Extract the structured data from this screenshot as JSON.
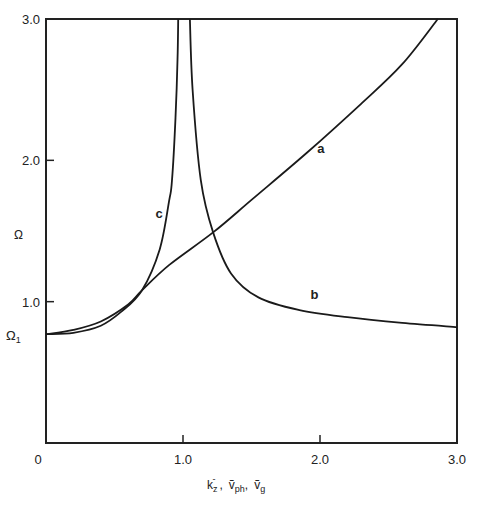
{
  "chart_data": {
    "type": "line",
    "title": "",
    "xlabel": "k_z^-, ṽ_ph, ṽ_g",
    "xlabel_parts": {
      "k": "k",
      "k_sub": "z",
      "k_sup": "-",
      "sep1": ",",
      "vph": "ṽ",
      "vph_sub": "ph",
      "sep2": ",",
      "vg": "ṽ",
      "vg_sub": "g"
    },
    "ylabel": "Ω",
    "xlim": [
      0,
      3.0
    ],
    "ylim": [
      0,
      3.0
    ],
    "grid": false,
    "x_ticks": [
      {
        "value": 0,
        "label": "0"
      },
      {
        "value": 1.0,
        "label": "1.0"
      },
      {
        "value": 2.0,
        "label": "2.0"
      },
      {
        "value": 3.0,
        "label": "3.0"
      }
    ],
    "y_ticks": [
      {
        "value": 1.0,
        "label": "1.0"
      },
      {
        "value": 2.0,
        "label": "2.0"
      },
      {
        "value": 3.0,
        "label": "3.0"
      }
    ],
    "y_annotation": {
      "value": 0.77,
      "label": "Ω",
      "sub": "1"
    },
    "series": [
      {
        "name": "a",
        "label_at": [
          1.98,
          2.05
        ],
        "x": [
          0,
          0.2,
          0.4,
          0.6,
          0.7,
          0.9,
          1.22,
          1.5,
          1.9,
          2.3,
          2.6,
          2.86
        ],
        "y": [
          0.77,
          0.8,
          0.86,
          0.98,
          1.08,
          1.26,
          1.49,
          1.72,
          2.05,
          2.4,
          2.68,
          3.0
        ]
      },
      {
        "name": "b",
        "label_at": [
          1.93,
          1.02
        ],
        "x": [
          1.05,
          1.07,
          1.13,
          1.22,
          1.35,
          1.55,
          1.85,
          2.2,
          2.6,
          3.0
        ],
        "y": [
          3.0,
          2.5,
          1.86,
          1.49,
          1.2,
          1.03,
          0.94,
          0.89,
          0.85,
          0.82
        ]
      },
      {
        "name": "c",
        "label_at": [
          0.8,
          1.59
        ],
        "x": [
          0,
          0.2,
          0.4,
          0.55,
          0.7,
          0.83,
          0.9,
          0.92,
          0.945,
          0.96,
          0.965
        ],
        "y": [
          0.77,
          0.78,
          0.83,
          0.93,
          1.08,
          1.37,
          1.72,
          1.86,
          2.3,
          2.71,
          3.0
        ]
      }
    ]
  }
}
